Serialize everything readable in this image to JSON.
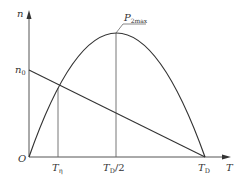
{
  "diagram": {
    "type": "power-speed curve",
    "colors": {
      "line": "#333333",
      "axis": "#555555",
      "background": "#ffffff"
    },
    "axes": {
      "y_label": "n",
      "x_label": "T",
      "origin_label": "O"
    },
    "y_ticks": [
      {
        "main": "n",
        "sub": "0"
      }
    ],
    "x_ticks": [
      {
        "main": "T",
        "sub": "η"
      },
      {
        "main": "T",
        "sub": "D",
        "suffix": "/2"
      },
      {
        "main": "T",
        "sub": "D"
      }
    ],
    "annotations": [
      {
        "main": "P",
        "sub": "2max"
      }
    ],
    "curves": [
      {
        "name": "mechanical-characteristic-line",
        "from": "n0 on y-axis",
        "to": "TD on x-axis"
      },
      {
        "name": "output-power-parabola",
        "from": "origin",
        "peak": "TD/2",
        "to": "TD"
      }
    ]
  }
}
